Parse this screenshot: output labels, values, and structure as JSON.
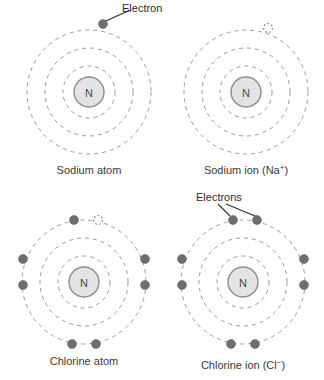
{
  "figure": {
    "nucleus_symbol": "N",
    "colors": {
      "shell_stroke": "#9a9a9a",
      "nucleus_fill": "#e3e3e3",
      "nucleus_stroke": "#8c8c8c",
      "electron_fill": "#6e6e6e",
      "vacancy_stroke": "#8f8f8f",
      "leader_stroke": "#2b2b2b",
      "text": "#3a3a3a",
      "background": "#ffffff"
    }
  },
  "panels": [
    {
      "id": "sodium-atom",
      "caption": "Sodium atom",
      "caption_main": "Sodium atom",
      "caption_sup": "",
      "caption_tail": "",
      "center": {
        "x": 89,
        "y": 92
      },
      "shell_radii": [
        26,
        44,
        62
      ],
      "nucleus_radius": 15,
      "electron_count": 1,
      "vacancy_count": 0,
      "callout": {
        "label": "Electron",
        "target": {
          "x": 103,
          "y": 24
        }
      },
      "electrons": [
        {
          "x": 103,
          "y": 24,
          "state": "filled"
        }
      ]
    },
    {
      "id": "sodium-ion",
      "caption": "Sodium ion (Na+)",
      "caption_main": "Sodium ion (Na",
      "caption_sup": "+",
      "caption_tail": ")",
      "center": {
        "x": 246,
        "y": 92
      },
      "shell_radii": [
        26,
        44,
        62
      ],
      "nucleus_radius": 15,
      "electron_count": 0,
      "vacancy_count": 1,
      "callout": null,
      "electrons": [
        {
          "x": 268,
          "y": 28,
          "state": "vacant"
        }
      ]
    },
    {
      "id": "chlorine-atom",
      "caption": "Chlorine atom",
      "caption_main": "Chlorine atom",
      "caption_sup": "",
      "caption_tail": "",
      "center": {
        "x": 84,
        "y": 282
      },
      "shell_radii": [
        26,
        44,
        62
      ],
      "nucleus_radius": 15,
      "electron_count": 7,
      "vacancy_count": 1,
      "callout": null,
      "electrons": [
        {
          "x": 74,
          "y": 220,
          "state": "filled"
        },
        {
          "x": 98,
          "y": 220,
          "state": "vacant"
        },
        {
          "x": 23,
          "y": 259,
          "state": "filled"
        },
        {
          "x": 23,
          "y": 285,
          "state": "filled"
        },
        {
          "x": 145,
          "y": 259,
          "state": "filled"
        },
        {
          "x": 145,
          "y": 285,
          "state": "filled"
        },
        {
          "x": 72,
          "y": 344,
          "state": "filled"
        },
        {
          "x": 96,
          "y": 344,
          "state": "filled"
        }
      ]
    },
    {
      "id": "chlorine-ion",
      "caption": "Chlorine ion (Cl-)",
      "caption_main": "Chlorine ion (Cl",
      "caption_sup": "−",
      "caption_tail": ")",
      "center": {
        "x": 243,
        "y": 282
      },
      "shell_radii": [
        26,
        44,
        62
      ],
      "nucleus_radius": 15,
      "electron_count": 8,
      "vacancy_count": 0,
      "callout": {
        "label": "Electrons",
        "targets": [
          {
            "x": 233,
            "y": 220
          },
          {
            "x": 257,
            "y": 220
          }
        ]
      },
      "electrons": [
        {
          "x": 233,
          "y": 220,
          "state": "filled"
        },
        {
          "x": 257,
          "y": 220,
          "state": "filled"
        },
        {
          "x": 182,
          "y": 259,
          "state": "filled"
        },
        {
          "x": 182,
          "y": 285,
          "state": "filled"
        },
        {
          "x": 304,
          "y": 259,
          "state": "filled"
        },
        {
          "x": 304,
          "y": 285,
          "state": "filled"
        },
        {
          "x": 231,
          "y": 344,
          "state": "filled"
        },
        {
          "x": 255,
          "y": 344,
          "state": "filled"
        }
      ]
    }
  ],
  "labels": {
    "electron_singular": "Electron",
    "electron_plural": "Electrons"
  }
}
